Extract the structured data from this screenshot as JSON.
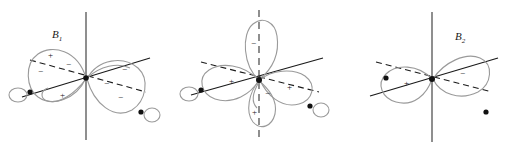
{
  "figure": {
    "title": "",
    "caption": "",
    "background_color": "#ffffff",
    "ink_color": "#1a1a1a",
    "lobe_outline_color": "#9a9a9a",
    "width": 513,
    "height": 155
  },
  "panels": [
    {
      "id": "b1",
      "label_main": "B",
      "label_sub": "1",
      "description": "in-plane pi-type orbital, two large lobes along the horizontal diagonal axis",
      "axes": [
        "vertical-z-axis",
        "solid-diagonal-axis",
        "dashed-diagonal-axis"
      ],
      "lobes": [
        {
          "sign": "+",
          "position": "upper-left"
        },
        {
          "sign": "-",
          "position": "mid-left"
        },
        {
          "sign": "+",
          "position": "lower-left"
        },
        {
          "sign": "-",
          "position": "upper-right"
        },
        {
          "sign": "-",
          "position": "mid-right"
        },
        {
          "sign": "-",
          "position": "lower-right"
        }
      ],
      "atom_markers": 2,
      "small_ring_count": 2
    },
    {
      "id": "b2",
      "label_main": "B",
      "label_sub": "2",
      "description": "orbital with a large vertical lobe above the origin and several lobes below",
      "axes": [
        "vertical-dashed-z-axis",
        "solid-diagonal-axis",
        "dashed-diagonal-axis"
      ],
      "lobes": [
        {
          "sign": "-",
          "position": "top-vertical"
        },
        {
          "sign": "+",
          "position": "left"
        },
        {
          "sign": "+",
          "position": "bottom-center"
        },
        {
          "sign": "+",
          "position": "right"
        },
        {
          "sign": "-",
          "position": "lower-center-small"
        }
      ],
      "atom_markers": 2,
      "small_ring_count": 2
    },
    {
      "id": "b3",
      "label_main": "B",
      "label_sub": "3",
      "description": "simple two-lobe p-type orbital along the dashed diagonal axis with two lone-pair dots",
      "axes": [
        "vertical-z-axis",
        "solid-diagonal-axis",
        "dashed-diagonal-axis"
      ],
      "lobes": [
        {
          "sign": "+",
          "position": "left"
        },
        {
          "sign": "-",
          "position": "right"
        }
      ],
      "atom_markers": 1,
      "dot_markers": 2,
      "small_ring_count": 0
    }
  ]
}
